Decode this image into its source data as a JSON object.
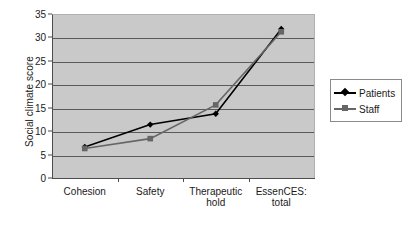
{
  "chart_data": {
    "type": "line",
    "title": "",
    "xlabel": "",
    "ylabel": "Social climate score",
    "categories": [
      "Cohesion",
      "Safety",
      "Therapeutic hold",
      "EssenCES: total"
    ],
    "category_lines": [
      [
        "Cohesion"
      ],
      [
        "Safety"
      ],
      [
        "Therapeutic",
        "hold"
      ],
      [
        "EssenCES:",
        "total"
      ]
    ],
    "series": [
      {
        "name": "Patients",
        "values": [
          6.6,
          11.4,
          13.7,
          31.8
        ],
        "color": "#000000",
        "marker": "diamond"
      },
      {
        "name": "Staff",
        "values": [
          6.3,
          8.4,
          15.6,
          31.2
        ],
        "color": "#666666",
        "marker": "square"
      }
    ],
    "ylim": [
      0,
      35
    ],
    "ytick_step": 5,
    "yticks": [
      "0",
      "5",
      "10",
      "15",
      "20",
      "25",
      "30",
      "35"
    ],
    "grid": true,
    "legend_position": "right",
    "plot_background": "#c9c9c9"
  },
  "legend": {
    "entries": [
      {
        "label": "Patients"
      },
      {
        "label": "Staff"
      }
    ]
  }
}
